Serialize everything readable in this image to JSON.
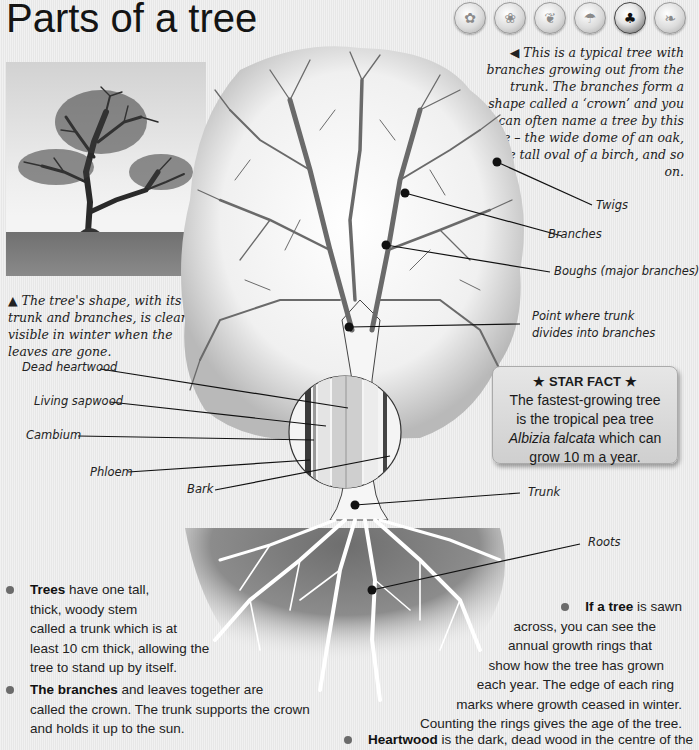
{
  "page": {
    "title": "Parts of a tree"
  },
  "nav_icons": [
    {
      "name": "animals-icon",
      "active": false
    },
    {
      "name": "plants-icon",
      "active": false
    },
    {
      "name": "leaf-icon",
      "active": false
    },
    {
      "name": "mushroom-icon",
      "active": false
    },
    {
      "name": "tree-icon",
      "active": true
    },
    {
      "name": "grain-icon",
      "active": false
    }
  ],
  "captions": {
    "photo": "▲ The tree's shape, with its trunk and branches, is clearly visible in winter when the leaves are gone.",
    "intro": "◀ This is a typical tree with branches growing out from the trunk. The branches form a shape called a ‘crown’ and you can often name a tree by this shape – the wide dome of an oak, the tall oval of a birch, and so on."
  },
  "labels": {
    "twigs": "Twigs",
    "branches": "Branches",
    "boughs": "Boughs (major branches)",
    "point_line1": "Point where trunk",
    "point_line2": "divides into branches",
    "dead_heartwood": "Dead heartwood",
    "living_sapwood": "Living sapwood",
    "cambium": "Cambium",
    "phloem": "Phloem",
    "bark": "Bark",
    "trunk": "Trunk",
    "roots": "Roots"
  },
  "star_fact": {
    "title": "★  STAR FACT  ★",
    "line1": "The fastest-growing tree",
    "line2": "is the tropical pea tree",
    "species": "Albizia falcata",
    "line3_rest": " which can",
    "line4": "grow 10 m a year."
  },
  "bullets": {
    "trees": {
      "bold": "Trees",
      "lines": [
        " have one tall,",
        "thick, woody stem",
        "called a trunk which is at",
        "least 10 cm thick, allowing the",
        "tree to stand up by itself."
      ]
    },
    "branches": {
      "bold": "The branches",
      "lines": [
        " and leaves together are",
        "called the crown. The trunk supports the crown",
        "and holds it up to the sun."
      ]
    },
    "rings": {
      "bold": "If a tree",
      "lines": [
        " is sawn",
        "across, you can see the",
        "annual growth rings that",
        "show how the tree has grown",
        "each year. The edge of each ring",
        "marks where growth ceased in winter.",
        "Counting the rings gives the age of the tree."
      ]
    },
    "heartwood": {
      "bold": "Heartwood",
      "rest": " is the dark, dead wood in the centre of the"
    }
  },
  "colors": {
    "background": "#ececec",
    "text": "#1a1a1a",
    "soil": "#7a7a7a",
    "bullet": "#6b6b6b"
  }
}
